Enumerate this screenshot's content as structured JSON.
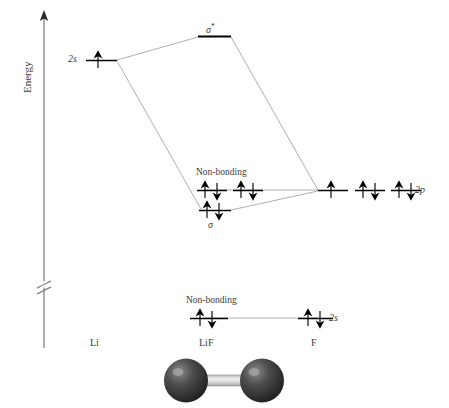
{
  "figure": {
    "type": "molecular-orbital-energy-diagram",
    "molecule": "LiF",
    "axis": {
      "label": "Energy",
      "direction": "up",
      "has_break": true
    },
    "column_labels": {
      "left": "Li",
      "center": "LiF",
      "right": "F"
    },
    "orbital_labels": {
      "li_2s": "2s",
      "f_2p": "2p",
      "f_2s": "2s",
      "sigma_star": "σ",
      "sigma_star_sup": "*",
      "sigma": "σ",
      "nonbonding_upper": "Non-bonding",
      "nonbonding_lower": "Non-bonding"
    },
    "levels": [
      {
        "name": "sigma-star",
        "label": "σ*",
        "column": "LiF",
        "electrons": 0,
        "occupancy": "empty",
        "energy_rank": 1
      },
      {
        "name": "li-2s",
        "label": "2s",
        "column": "Li",
        "electrons": 1,
        "occupancy": "single-up",
        "energy_rank": 2
      },
      {
        "name": "nonbonding-2p",
        "label": "Non-bonding",
        "column": "LiF",
        "electrons": 4,
        "occupancy": "two-pairs",
        "energy_rank": 3
      },
      {
        "name": "f-2p",
        "label": "2p",
        "column": "F",
        "electrons": 5,
        "occupancy": "one-single-two-pairs",
        "energy_rank": 3
      },
      {
        "name": "sigma",
        "label": "σ",
        "column": "LiF",
        "electrons": 2,
        "occupancy": "one-pair",
        "energy_rank": 4
      },
      {
        "name": "nonbonding-2s",
        "label": "Non-bonding",
        "column": "LiF",
        "electrons": 2,
        "occupancy": "one-pair",
        "energy_rank": 5
      },
      {
        "name": "f-2s",
        "label": "2s",
        "column": "F",
        "electrons": 2,
        "occupancy": "one-pair",
        "energy_rank": 5
      }
    ],
    "molecule_model": {
      "atoms": 2,
      "bond": "single",
      "atom_color": "#3d3d3d",
      "bond_color": "#d8d8d8"
    },
    "colors": {
      "text": "#3a3a3a",
      "level_line": "#000000",
      "correlation_line": "#8c8c8c",
      "axis": "#8c8c8c",
      "background": "#ffffff"
    }
  }
}
